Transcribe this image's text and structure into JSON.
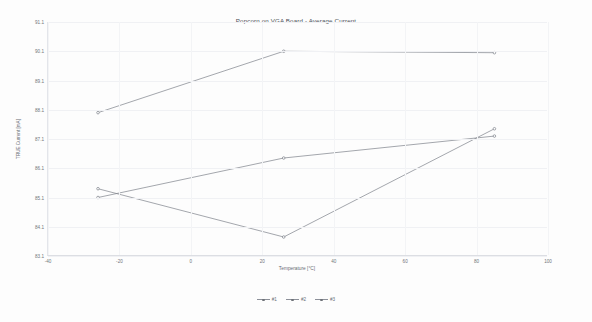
{
  "chart_data": {
    "type": "line",
    "title": "Popcorn on VGA Board - Average Current",
    "xlabel": "Temperature [°C]",
    "ylabel": "TRUE Current [mA]",
    "xlim": [
      -40,
      100
    ],
    "ylim": [
      83.1,
      91.1
    ],
    "grid": true,
    "legend_position": "bottom",
    "xticks": [
      -40,
      -20,
      0,
      20,
      40,
      60,
      80,
      100
    ],
    "xtick_labels": [
      "-40",
      "-20",
      "0",
      "20",
      "40",
      "60",
      "80",
      "100"
    ],
    "yticks": [
      83.1,
      84.1,
      85.1,
      86.1,
      87.1,
      88.1,
      89.1,
      90.1,
      91.1
    ],
    "ytick_labels": [
      "83.1",
      "84.1",
      "85.1",
      "86.1",
      "87.1",
      "88.1",
      "89.1",
      "90.1",
      "91.1"
    ],
    "x": [
      -26,
      26,
      85
    ],
    "series": [
      {
        "name": "#1",
        "marker": "circle",
        "color": "#7d8189",
        "x": [
          -26,
          26,
          85
        ],
        "values": [
          88.0,
          90.1,
          90.05
        ]
      },
      {
        "name": "#2",
        "marker": "circle",
        "color": "#7d8189",
        "x": [
          -26,
          26,
          85
        ],
        "values": [
          85.1,
          86.45,
          87.2
        ]
      },
      {
        "name": "#3",
        "marker": "circle",
        "color": "#7d8189",
        "x": [
          -26,
          26,
          85
        ],
        "values": [
          85.4,
          83.75,
          87.45
        ]
      }
    ]
  },
  "legend": {
    "items": [
      {
        "label": "#1"
      },
      {
        "label": "#2"
      },
      {
        "label": "#3"
      }
    ]
  }
}
